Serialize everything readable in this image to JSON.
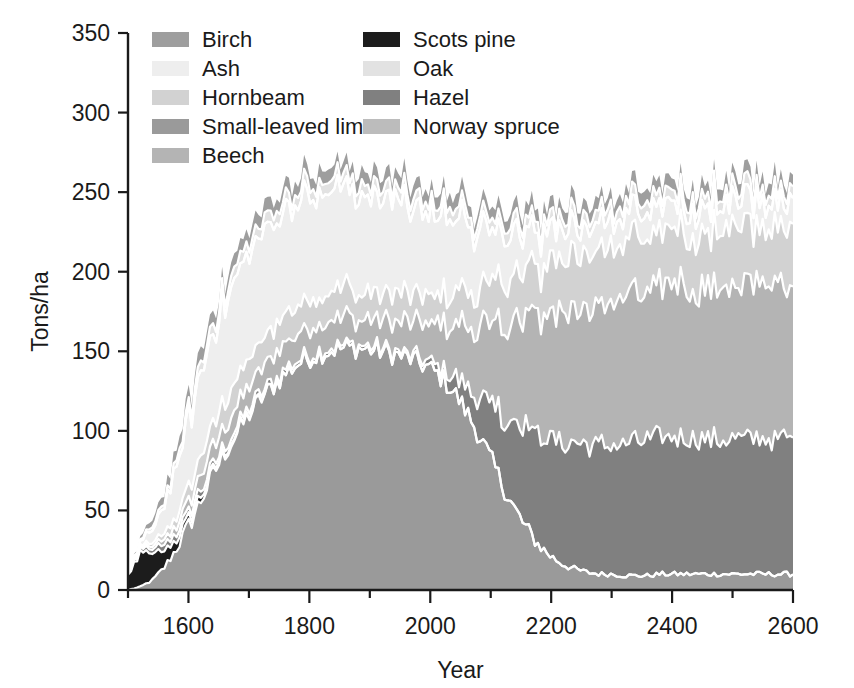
{
  "chart_data": {
    "type": "area",
    "stacked": true,
    "title": "",
    "xlabel": "Year",
    "ylabel": "Tons/ha",
    "xlim": [
      1500,
      2600
    ],
    "ylim": [
      0,
      350
    ],
    "xticks": [
      1600,
      1800,
      2000,
      2200,
      2400,
      2600
    ],
    "xtick_labels": [
      "1600",
      "1800",
      "2000",
      "2200",
      "2400",
      "2600"
    ],
    "xminor_step": 100,
    "yticks": [
      0,
      50,
      100,
      150,
      200,
      250,
      300,
      350
    ],
    "ytick_labels": [
      "0",
      "50",
      "100",
      "150",
      "200",
      "250",
      "300",
      "350"
    ],
    "grid": false,
    "legend_position": "upper-left-inside",
    "x": [
      1500,
      1520,
      1540,
      1560,
      1580,
      1600,
      1620,
      1640,
      1660,
      1680,
      1700,
      1720,
      1740,
      1760,
      1780,
      1800,
      1820,
      1840,
      1860,
      1880,
      1900,
      1920,
      1940,
      1960,
      1980,
      2000,
      2020,
      2040,
      2060,
      2080,
      2100,
      2120,
      2140,
      2160,
      2180,
      2200,
      2220,
      2240,
      2260,
      2280,
      2300,
      2320,
      2340,
      2360,
      2380,
      2400,
      2420,
      2440,
      2460,
      2480,
      2500,
      2520,
      2540,
      2560,
      2580,
      2600
    ],
    "series": [
      {
        "name": "Small-leaved lime",
        "color": "#9a9a9a",
        "values": [
          0,
          2,
          6,
          14,
          26,
          40,
          56,
          72,
          86,
          98,
          110,
          120,
          128,
          136,
          142,
          146,
          149,
          151,
          152,
          152,
          151,
          150,
          148,
          146,
          143,
          139,
          133,
          124,
          112,
          98,
          82,
          66,
          50,
          38,
          28,
          21,
          16,
          13,
          11,
          10,
          10,
          9,
          9,
          9,
          10,
          10,
          10,
          10,
          10,
          10,
          10,
          10,
          10,
          10,
          10,
          10
        ]
      },
      {
        "name": "Scots pine",
        "color": "#1c1c1c",
        "values": [
          10,
          20,
          16,
          10,
          6,
          4,
          3,
          2,
          2,
          1,
          1,
          1,
          0,
          0,
          0,
          0,
          0,
          0,
          0,
          0,
          0,
          0,
          0,
          0,
          0,
          0,
          0,
          0,
          0,
          0,
          0,
          0,
          0,
          0,
          0,
          0,
          0,
          0,
          0,
          0,
          0,
          0,
          0,
          0,
          0,
          0,
          0,
          0,
          0,
          0,
          0,
          0,
          0,
          0,
          0,
          0
        ]
      },
      {
        "name": "Hazel",
        "color": "#808080",
        "values": [
          1,
          2,
          3,
          4,
          4,
          4,
          4,
          3,
          3,
          3,
          3,
          3,
          3,
          3,
          2,
          2,
          2,
          2,
          2,
          2,
          2,
          2,
          2,
          2,
          3,
          4,
          6,
          10,
          16,
          24,
          34,
          45,
          56,
          64,
          70,
          74,
          77,
          79,
          80,
          81,
          82,
          83,
          84,
          85,
          86,
          86,
          86,
          85,
          85,
          85,
          85,
          85,
          85,
          85,
          85,
          85
        ]
      },
      {
        "name": "Beech",
        "color": "#b4b4b4",
        "values": [
          0,
          1,
          2,
          3,
          5,
          7,
          9,
          11,
          12,
          13,
          14,
          15,
          16,
          16,
          17,
          17,
          17,
          17,
          17,
          17,
          17,
          18,
          19,
          20,
          22,
          24,
          27,
          31,
          36,
          42,
          49,
          56,
          63,
          69,
          74,
          78,
          81,
          84,
          86,
          88,
          90,
          91,
          92,
          93,
          94,
          95,
          95,
          95,
          95,
          95,
          95,
          95,
          95,
          95,
          95,
          95
        ]
      },
      {
        "name": "Hornbeam",
        "color": "#d2d2d2",
        "values": [
          0,
          1,
          2,
          4,
          6,
          9,
          12,
          14,
          16,
          17,
          18,
          18,
          18,
          18,
          18,
          18,
          18,
          18,
          18,
          18,
          18,
          18,
          18,
          18,
          18,
          18,
          19,
          20,
          22,
          24,
          26,
          28,
          29,
          30,
          31,
          32,
          33,
          33,
          34,
          34,
          35,
          35,
          35,
          35,
          35,
          35,
          35,
          35,
          35,
          35,
          35,
          35,
          35,
          35,
          35,
          35
        ]
      },
      {
        "name": "Ash",
        "color": "#eeeeee",
        "values": [
          0,
          2,
          8,
          18,
          30,
          42,
          52,
          58,
          62,
          64,
          66,
          66,
          66,
          66,
          66,
          65,
          64,
          63,
          62,
          61,
          60,
          59,
          58,
          56,
          54,
          52,
          49,
          46,
          42,
          38,
          34,
          30,
          27,
          24,
          22,
          20,
          19,
          18,
          17,
          16,
          16,
          16,
          16,
          16,
          16,
          16,
          16,
          16,
          16,
          16,
          16,
          16,
          16,
          16,
          16,
          16
        ]
      },
      {
        "name": "Norway spruce",
        "color": "#bcbcbc",
        "values": [
          0,
          0,
          0,
          0,
          0,
          0,
          0,
          0,
          0,
          0,
          0,
          0,
          0,
          0,
          0,
          0,
          0,
          0,
          0,
          0,
          0,
          0,
          0,
          0,
          0,
          0,
          0,
          0,
          0,
          0,
          0,
          0,
          0,
          0,
          0,
          0,
          0,
          0,
          0,
          0,
          0,
          0,
          0,
          0,
          0,
          0,
          0,
          0,
          0,
          0,
          0,
          0,
          0,
          0,
          0,
          0
        ]
      },
      {
        "name": "Oak",
        "color": "#e2e2e2",
        "values": [
          0,
          1,
          2,
          3,
          4,
          5,
          6,
          6,
          7,
          7,
          7,
          7,
          7,
          7,
          7,
          7,
          7,
          7,
          7,
          7,
          7,
          7,
          7,
          7,
          7,
          7,
          7,
          7,
          7,
          7,
          7,
          7,
          7,
          7,
          7,
          7,
          7,
          7,
          7,
          7,
          7,
          7,
          7,
          7,
          7,
          7,
          7,
          7,
          7,
          7,
          7,
          7,
          7,
          7,
          7,
          7
        ]
      },
      {
        "name": "Birch",
        "color": "#9e9e9e",
        "values": [
          0,
          2,
          4,
          6,
          7,
          8,
          8,
          8,
          8,
          8,
          8,
          8,
          8,
          8,
          8,
          8,
          8,
          8,
          8,
          8,
          8,
          8,
          8,
          8,
          8,
          8,
          8,
          8,
          8,
          8,
          8,
          8,
          8,
          8,
          8,
          8,
          8,
          8,
          8,
          8,
          8,
          8,
          8,
          8,
          8,
          8,
          8,
          8,
          8,
          8,
          8,
          8,
          8,
          8,
          8,
          8
        ]
      }
    ],
    "total_top": [
      11,
      28,
      43,
      62,
      82,
      99,
      117,
      130,
      141,
      152,
      162,
      172,
      180,
      184,
      190,
      198,
      204,
      205,
      206,
      207,
      210,
      209,
      208,
      209,
      210,
      215,
      218,
      220,
      222,
      226,
      228,
      232,
      236,
      238,
      240,
      243,
      246,
      248,
      250,
      252,
      253,
      255,
      256,
      258,
      260,
      262,
      264,
      268,
      272,
      268,
      266,
      264,
      262,
      260,
      258,
      256
    ]
  },
  "legend": {
    "col1": [
      {
        "label": "Birch",
        "color": "#9e9e9e"
      },
      {
        "label": "Ash",
        "color": "#eeeeee"
      },
      {
        "label": "Hornbeam",
        "color": "#d2d2d2"
      },
      {
        "label": "Small-leaved lime",
        "color": "#9a9a9a"
      },
      {
        "label": "Beech",
        "color": "#b4b4b4"
      }
    ],
    "col2": [
      {
        "label": "Scots pine",
        "color": "#1c1c1c"
      },
      {
        "label": "Oak",
        "color": "#e2e2e2"
      },
      {
        "label": "Hazel",
        "color": "#808080"
      },
      {
        "label": "Norway spruce",
        "color": "#bcbcbc"
      }
    ]
  }
}
